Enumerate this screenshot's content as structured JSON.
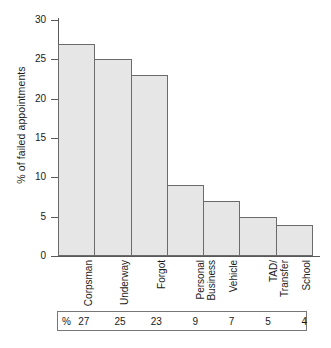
{
  "chart_data": {
    "type": "bar",
    "title": "",
    "xlabel": "",
    "ylabel": "% of failed appointments",
    "categories": [
      "Corpsman",
      "Underway",
      "Forgot",
      "Personal\nBusiness",
      "Vehicle",
      "TAD/\nTransfer",
      "School"
    ],
    "values": [
      27,
      25,
      23,
      9,
      7,
      5,
      4
    ],
    "ylim": [
      0,
      30
    ],
    "yticks": [
      0,
      5,
      10,
      15,
      20,
      25,
      30
    ],
    "ytick_labels": [
      "0",
      "5",
      "10",
      "15",
      "20",
      "25",
      "30"
    ],
    "grid": false,
    "legend": null,
    "bar_fill_color": "#e6e6e6",
    "bar_border_color": "#6b6b6b",
    "axis_color": "#595959"
  },
  "axis": {
    "y_title": "% of failed appointments",
    "tick_labels": [
      "30",
      "25",
      "20",
      "15",
      "10",
      "5",
      "0"
    ]
  },
  "categories": [
    {
      "label": "Corpsman",
      "lines": [
        "Corpsman"
      ]
    },
    {
      "label": "Underway",
      "lines": [
        "Underway"
      ]
    },
    {
      "label": "Forgot",
      "lines": [
        "Forgot"
      ]
    },
    {
      "label": "Personal Business",
      "lines": [
        "Personal",
        "Business"
      ]
    },
    {
      "label": "Vehicle",
      "lines": [
        "Vehicle"
      ]
    },
    {
      "label": "TAD/Transfer",
      "lines": [
        "TAD/",
        "Transfer"
      ]
    },
    {
      "label": "School",
      "lines": [
        "School"
      ]
    }
  ],
  "table": {
    "row_prefix": "%",
    "cells": [
      "27",
      "25",
      "23",
      "9",
      "7",
      "5",
      "4"
    ]
  }
}
